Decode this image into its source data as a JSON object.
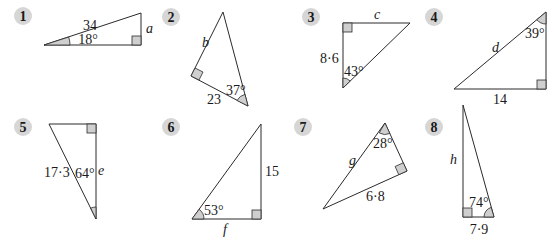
{
  "exercise": {
    "problems": [
      {
        "number": "1",
        "hypotenuse": "34",
        "angle": "18°",
        "unknown": "a"
      },
      {
        "number": "2",
        "side": "23",
        "angle": "37°",
        "unknown": "b"
      },
      {
        "number": "3",
        "side": "8·6",
        "angle": "43°",
        "unknown": "c"
      },
      {
        "number": "4",
        "side": "14",
        "angle": "39°",
        "unknown": "d"
      },
      {
        "number": "5",
        "hypotenuse": "17·3",
        "angle": "64°",
        "unknown": "e"
      },
      {
        "number": "6",
        "side": "15",
        "angle": "53°",
        "unknown": "f"
      },
      {
        "number": "7",
        "side": "6·8",
        "angle": "28°",
        "unknown": "g"
      },
      {
        "number": "8",
        "side": "7·9",
        "angle": "74°",
        "unknown": "h"
      }
    ]
  },
  "colors": {
    "badge_fill": "#d6d6d6",
    "shade_fill": "#cfcfcf",
    "line": "#2a2a2a"
  }
}
